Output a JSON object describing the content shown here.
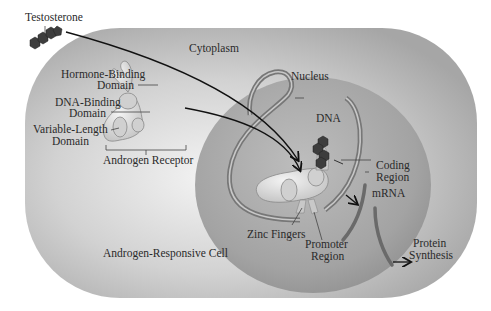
{
  "labels": {
    "testosterone": "Testosterone",
    "cytoplasm": "Cytoplasm",
    "nucleus": "Nucleus",
    "hormone_binding_1": "Hormone-Binding",
    "hormone_binding_2": "Domain",
    "dna_binding_1": "DNA-Binding",
    "dna_binding_2": "Domain",
    "variable_length_1": "Variable-Length",
    "variable_length_2": "Domain",
    "androgen_receptor": "Androgen Receptor",
    "dna": "DNA",
    "coding_region_1": "Coding",
    "coding_region_2": "Region",
    "mrna": "mRNA",
    "zinc_fingers": "Zinc Fingers",
    "promoter_region_1": "Promoter",
    "promoter_region_2": "Region",
    "protein_synthesis_1": "Protein",
    "protein_synthesis_2": "Synthesis",
    "cell": "Androgen-Responsive Cell"
  },
  "colors": {
    "cell_fill": "#b8b8b8",
    "cell_highlight": "#f2f2f2",
    "nucleus_fill": "#9a9a9a",
    "dna_strand": "#7a7a7a",
    "receptor": "#e2e2e2",
    "hormone": "#3a3a3a",
    "arrow": "#111111"
  }
}
